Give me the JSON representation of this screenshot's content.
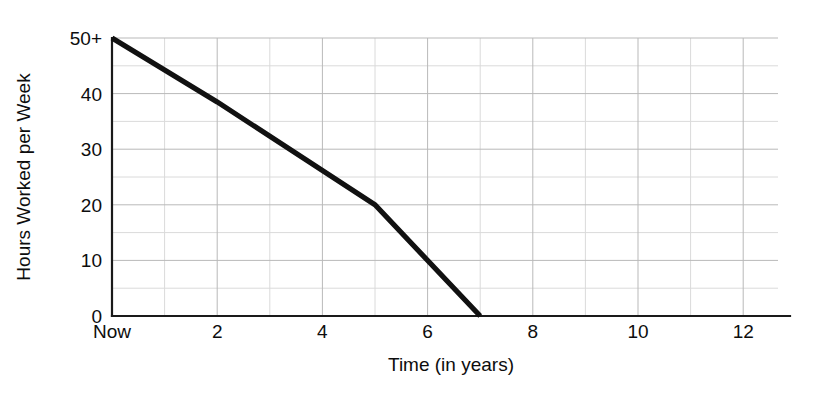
{
  "chart_data": {
    "type": "line",
    "title": "",
    "xlabel": "Time (in years)",
    "ylabel": "Hours Worked per Week",
    "xlim": [
      0,
      12.7
    ],
    "ylim": [
      0,
      50
    ],
    "grid": true,
    "legend": "none",
    "x_tick_labels": [
      "Now",
      "2",
      "4",
      "6",
      "8",
      "10",
      "12"
    ],
    "x_tick_values": [
      0,
      2,
      4,
      6,
      8,
      10,
      12
    ],
    "x_minor_step": 1,
    "y_tick_labels": [
      "0",
      "10",
      "20",
      "30",
      "40",
      "50+"
    ],
    "y_tick_values": [
      0,
      10,
      20,
      30,
      40,
      50
    ],
    "y_minor_step": 5,
    "series": [
      {
        "name": "Hours worked per week",
        "color": "#111111",
        "x": [
          0,
          2,
          5,
          7
        ],
        "values": [
          50,
          38.5,
          20,
          0
        ]
      }
    ],
    "annotations": []
  },
  "axes": {
    "y_title": "Hours Worked per Week",
    "x_title": "Time (in years)"
  },
  "ticks": {
    "x": [
      {
        "label": "Now",
        "value": 0
      },
      {
        "label": "2",
        "value": 2
      },
      {
        "label": "4",
        "value": 4
      },
      {
        "label": "6",
        "value": 6
      },
      {
        "label": "8",
        "value": 8
      },
      {
        "label": "10",
        "value": 10
      },
      {
        "label": "12",
        "value": 12
      }
    ],
    "y": [
      {
        "label": "0",
        "value": 0
      },
      {
        "label": "10",
        "value": 10
      },
      {
        "label": "20",
        "value": 20
      },
      {
        "label": "30",
        "value": 30
      },
      {
        "label": "40",
        "value": 40
      },
      {
        "label": "50+",
        "value": 50
      }
    ]
  }
}
